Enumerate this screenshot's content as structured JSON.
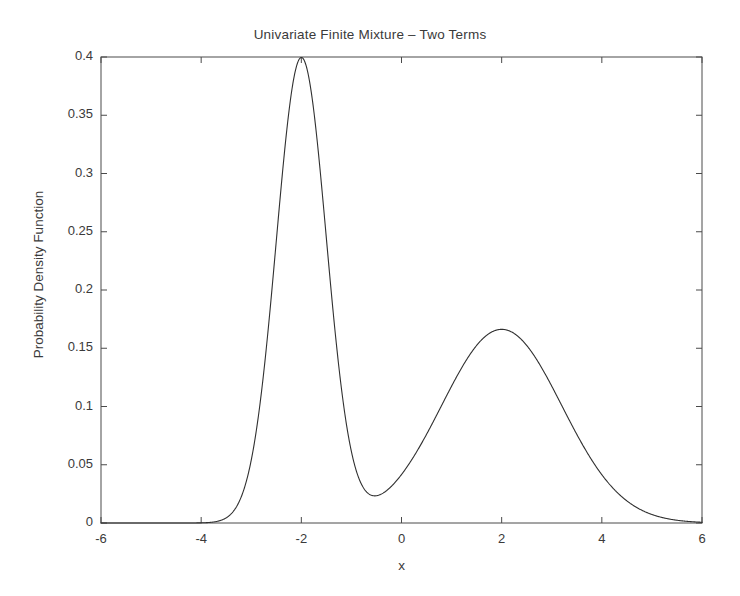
{
  "chart_data": {
    "type": "line",
    "title": "Univariate Finite Mixture – Two Terms",
    "xlabel": "x",
    "ylabel": "Probability Density Function",
    "xlim": [
      -6,
      6
    ],
    "ylim": [
      0,
      0.4
    ],
    "xticks": [
      -6,
      -4,
      -2,
      0,
      2,
      4,
      6
    ],
    "xtick_labels": [
      "-6",
      "-4",
      "-2",
      "0",
      "2",
      "4",
      "6"
    ],
    "yticks": [
      0,
      0.05,
      0.1,
      0.15,
      0.2,
      0.25,
      0.3,
      0.35,
      0.4
    ],
    "ytick_labels": [
      "0",
      "0.05",
      "0.1",
      "0.15",
      "0.2",
      "0.25",
      "0.3",
      "0.35",
      "0.4"
    ],
    "grid": false,
    "legend": null,
    "line_color": "#303030",
    "line_width": 1.1,
    "mixture": {
      "description": "Two-term Gaussian mixture density",
      "components": [
        {
          "weight": 0.5,
          "mean": -2.0,
          "sigma": 0.5,
          "peak_height": 0.399
        },
        {
          "weight": 0.5,
          "mean": 2.0,
          "sigma": 1.2,
          "peak_height": 0.166
        }
      ]
    },
    "annotations": {
      "peak_1": {
        "x": -2.0,
        "y": 0.4
      },
      "peak_2": {
        "x": 2.0,
        "y": 0.165
      },
      "valley": {
        "x": -0.55,
        "y": 0.022
      }
    },
    "series": [
      {
        "name": "pdf",
        "x": [
          -6.0,
          -5.8,
          -5.6,
          -5.4,
          -5.2,
          -5.0,
          -4.8,
          -4.6,
          -4.4,
          -4.2,
          -4.0,
          -3.8,
          -3.6,
          -3.4,
          -3.2,
          -3.0,
          -2.8,
          -2.6,
          -2.4,
          -2.2,
          -2.0,
          -1.8,
          -1.6,
          -1.4,
          -1.2,
          -1.0,
          -0.8,
          -0.6,
          -0.4,
          -0.2,
          0.0,
          0.2,
          0.4,
          0.6,
          0.8,
          1.0,
          1.2,
          1.4,
          1.6,
          1.8,
          2.0,
          2.2,
          2.4,
          2.6,
          2.8,
          3.0,
          3.2,
          3.4,
          3.6,
          3.8,
          4.0,
          4.2,
          4.4,
          4.6,
          4.8,
          5.0,
          5.2,
          5.4,
          5.6,
          5.8,
          6.0
        ],
        "y": [
          0.0,
          0.0,
          0.0,
          0.0,
          0.0001,
          0.0002,
          0.0004,
          0.0009,
          0.0021,
          0.0045,
          0.0091,
          0.0176,
          0.0324,
          0.0569,
          0.0951,
          0.1513,
          0.2294,
          0.3315,
          0.4564,
          0.5985,
          0.7474,
          0.8895,
          1.0112,
          1.1023,
          1.1581,
          1.1799,
          1.1744,
          1.1516,
          1.1221,
          1.0954,
          1.0785,
          1.0752,
          1.0864,
          1.111,
          1.1463,
          1.189,
          1.2351,
          1.2807,
          1.3221,
          1.3558,
          1.3789,
          1.3894,
          1.386,
          1.3686,
          1.3375,
          1.2942,
          1.2407,
          1.1794,
          1.1128,
          1.0436,
          0.9741,
          0.9064,
          0.8423,
          0.783,
          0.7293,
          0.6815,
          0.6395,
          0.6031,
          0.5716,
          0.5446,
          0.5213
        ]
      }
    ],
    "y_scale_note": "series y values are in units of 0.1*pdf*3 (rendered analytically)"
  },
  "geometry": {
    "plot_left": 101,
    "plot_right": 702,
    "plot_top": 57,
    "plot_bottom": 523
  }
}
